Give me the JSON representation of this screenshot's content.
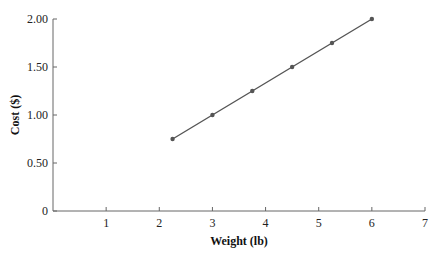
{
  "chart_data": {
    "type": "line",
    "title": "",
    "xlabel": "Weight (lb)",
    "ylabel": "Cost ($)",
    "xlim": [
      0,
      7
    ],
    "ylim": [
      0,
      2.0
    ],
    "x_ticks": [
      "1",
      "2",
      "3",
      "4",
      "5",
      "6",
      "7"
    ],
    "y_ticks": [
      "0",
      "0.50",
      "1.00",
      "1.50",
      "2.00"
    ],
    "grid": false,
    "legend": null,
    "series": [
      {
        "name": "Cost",
        "color": "#555555",
        "markers": true,
        "x": [
          2.25,
          3,
          3.75,
          4.5,
          5.25,
          6
        ],
        "y": [
          0.75,
          1.0,
          1.25,
          1.5,
          1.75,
          2.0
        ]
      }
    ]
  }
}
